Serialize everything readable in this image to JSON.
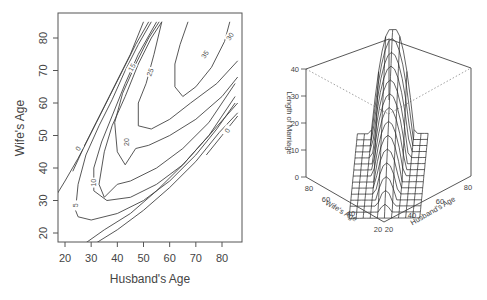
{
  "chart_data": [
    {
      "type": "contour",
      "title": "",
      "xlabel": "Husband's Age",
      "ylabel": "Wife's Age",
      "xlim": [
        17,
        87
      ],
      "ylim": [
        17,
        87
      ],
      "x_ticks": [
        20,
        30,
        40,
        50,
        60,
        70,
        80
      ],
      "y_ticks": [
        20,
        30,
        40,
        50,
        60,
        70,
        80
      ],
      "x_tick_labels": [
        "20",
        "30",
        "40",
        "50",
        "60",
        "70",
        "80"
      ],
      "y_tick_labels": [
        "20",
        "30",
        "40",
        "50",
        "60",
        "70",
        "80"
      ],
      "contour_levels": [
        0,
        5,
        10,
        15,
        20,
        25,
        30,
        35
      ],
      "contour_labels": [
        {
          "text": "0",
          "x": 25,
          "y": 46,
          "rot": -60
        },
        {
          "text": "5",
          "x": 24,
          "y": 28.5,
          "rot": -90
        },
        {
          "text": "10",
          "x": 31,
          "y": 35.5,
          "rot": -90
        },
        {
          "text": "20",
          "x": 43.5,
          "y": 48,
          "rot": -90
        },
        {
          "text": "15",
          "x": 45.5,
          "y": 71,
          "rot": -60
        },
        {
          "text": "25",
          "x": 52.5,
          "y": 69.5,
          "rot": -70
        },
        {
          "text": "35",
          "x": 73.5,
          "y": 75,
          "rot": -55
        },
        {
          "text": "30",
          "x": 83,
          "y": 80.5,
          "rot": -55
        },
        {
          "text": "0",
          "x": 82,
          "y": 51.5,
          "rot": -60
        }
      ],
      "grid": false,
      "legend": null
    },
    {
      "type": "surface3d",
      "title": "",
      "xlabel": "Husband's Age",
      "ylabel": "Wife's Age",
      "zlabel": "Length of Marriage",
      "x_ticks": [
        "20",
        "40",
        "60",
        "80"
      ],
      "y_ticks": [
        "20",
        "40",
        "60",
        "80"
      ],
      "z_ticks": [
        "0",
        "10",
        "20",
        "30",
        "40"
      ],
      "zlim": [
        0,
        40
      ],
      "peak_value": 38,
      "grid": false,
      "legend": null
    }
  ]
}
